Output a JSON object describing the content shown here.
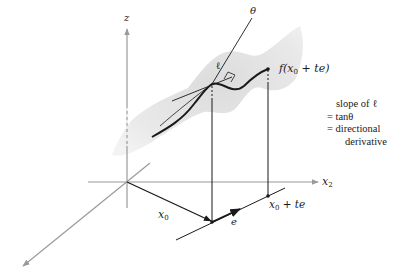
{
  "figure": {
    "type": "3d-surface-directional-derivative",
    "colors": {
      "surface": "#e6e6e6",
      "axes": "#9a9a9a",
      "ink": "#1a1a1a"
    }
  },
  "labels": {
    "z_axis": "z",
    "x2_axis_main": "x",
    "x2_axis_sub": "2",
    "x0_main": "x",
    "x0_sub": "0",
    "e": "e",
    "point_main": "x",
    "point_sub": "0",
    "point_rest": " + te",
    "theta": "θ",
    "ell": "ℓ",
    "curve_f": "f(x",
    "curve_sub": "0",
    "curve_rest": " + te)"
  },
  "annotation": {
    "lines": [
      "slope of ℓ",
      "= tanθ",
      "= directional",
      "derivative"
    ]
  }
}
